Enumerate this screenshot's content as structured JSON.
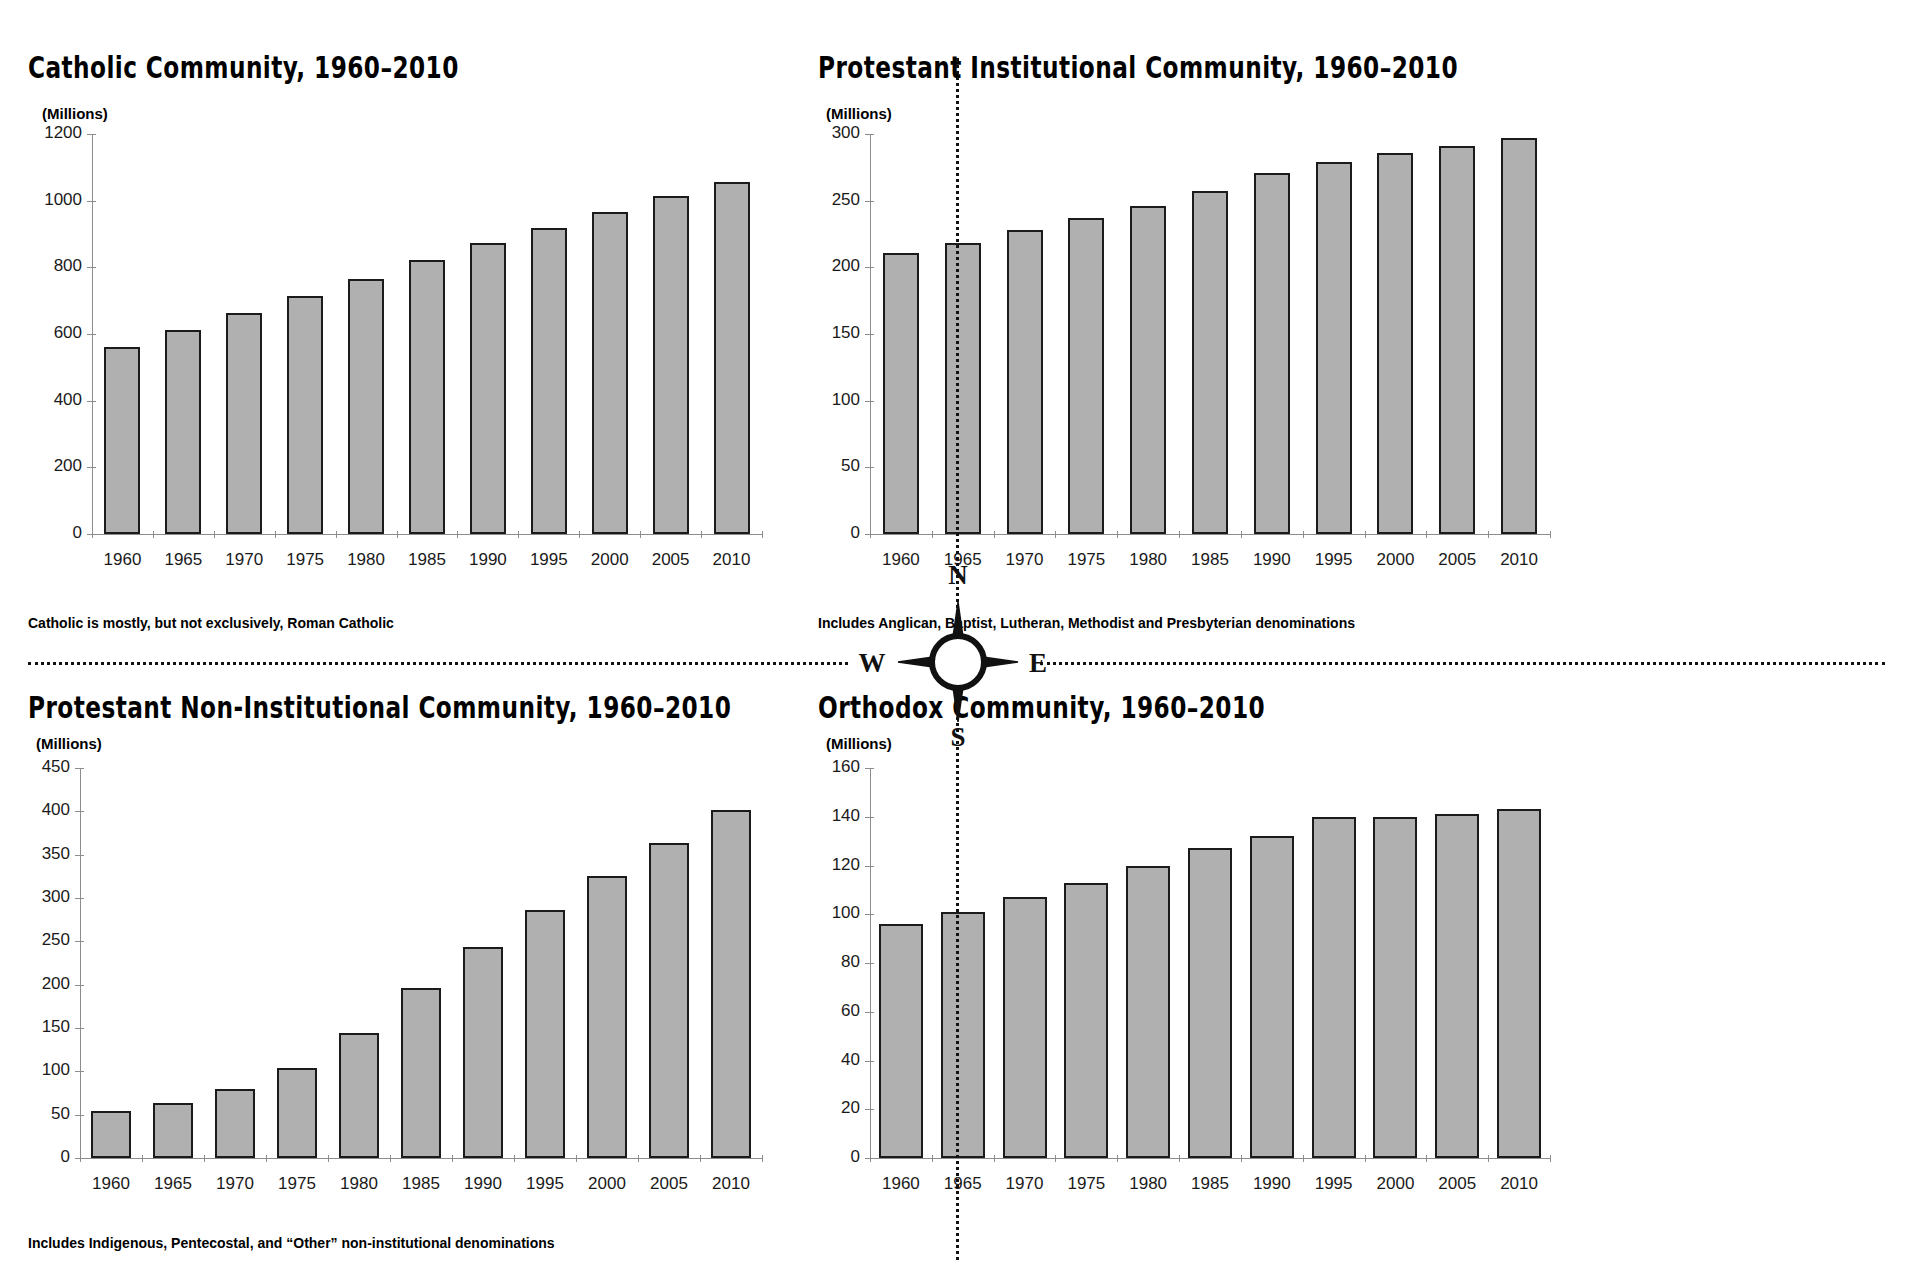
{
  "chart_data": [
    {
      "type": "bar",
      "id": "catholic",
      "title": "Catholic Community, 1960–2010",
      "ylabel": "(Millions)",
      "xlabel": "",
      "footnote": "Catholic is mostly, but not exclusively, Roman Catholic",
      "categories": [
        "1960",
        "1965",
        "1970",
        "1975",
        "1980",
        "1985",
        "1990",
        "1995",
        "2000",
        "2005",
        "2010"
      ],
      "values": [
        560,
        613,
        663,
        715,
        765,
        822,
        872,
        917,
        967,
        1013,
        1055
      ],
      "ylim": [
        0,
        1200
      ],
      "yticks": [
        0,
        200,
        400,
        600,
        800,
        1000,
        1200
      ],
      "grid": false,
      "legend": "none"
    },
    {
      "type": "bar",
      "id": "protestant-institutional",
      "title": "Protestant Institutional Community, 1960–2010",
      "ylabel": "(Millions)",
      "xlabel": "",
      "footnote": "Includes Anglican, Baptist, Lutheran, Methodist and Presbyterian denominations",
      "categories": [
        "1960",
        "1965",
        "1970",
        "1975",
        "1980",
        "1985",
        "1990",
        "1995",
        "2000",
        "2005",
        "2010"
      ],
      "values": [
        211,
        218,
        228,
        237,
        246,
        257,
        271,
        279,
        286,
        291,
        297
      ],
      "ylim": [
        0,
        300
      ],
      "yticks": [
        0,
        50,
        100,
        150,
        200,
        250,
        300
      ],
      "grid": false,
      "legend": "none"
    },
    {
      "type": "bar",
      "id": "protestant-non-institutional",
      "title": "Protestant Non-Institutional Community, 1960–2010",
      "ylabel": "(Millions)",
      "xlabel": "",
      "footnote": "Includes Indigenous, Pentecostal, and “Other” non-institutional denominations",
      "categories": [
        "1960",
        "1965",
        "1970",
        "1975",
        "1980",
        "1985",
        "1990",
        "1995",
        "2000",
        "2005",
        "2010"
      ],
      "values": [
        54,
        64,
        80,
        104,
        144,
        196,
        244,
        286,
        325,
        364,
        401
      ],
      "ylim": [
        0,
        450
      ],
      "yticks": [
        0,
        50,
        100,
        150,
        200,
        250,
        300,
        350,
        400,
        450
      ],
      "grid": false,
      "legend": "none"
    },
    {
      "type": "bar",
      "id": "orthodox",
      "title": "Orthodox Community, 1960–2010",
      "ylabel": "(Millions)",
      "xlabel": "",
      "footnote": "",
      "categories": [
        "1960",
        "1965",
        "1970",
        "1975",
        "1980",
        "1985",
        "1990",
        "1995",
        "2000",
        "2005",
        "2010"
      ],
      "values": [
        96,
        101,
        107,
        113,
        120,
        127,
        132,
        140,
        140,
        141,
        143
      ],
      "ylim": [
        0,
        160
      ],
      "yticks": [
        0,
        20,
        40,
        60,
        80,
        100,
        120,
        140,
        160
      ],
      "grid": false,
      "legend": "none"
    }
  ],
  "compass": {
    "north": "N",
    "south": "S",
    "east": "E",
    "west": "W"
  },
  "colors": {
    "bar_fill": "#b0b0b0",
    "bar_stroke": "#1b1b1b",
    "axis": "#8d8d8d",
    "text": "#111111"
  }
}
